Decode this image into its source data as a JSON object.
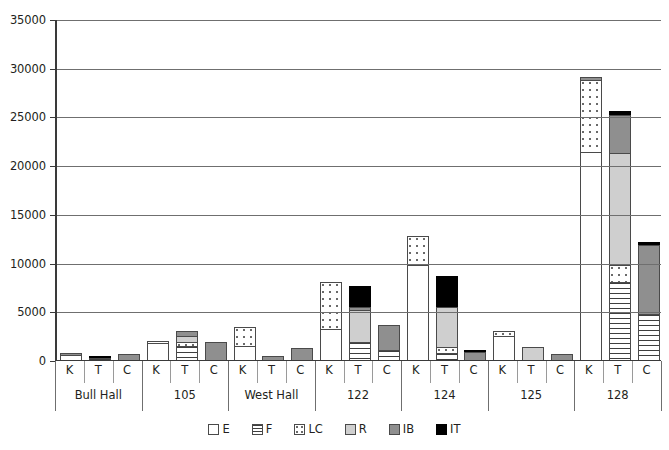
{
  "chart_data": {
    "type": "bar",
    "subtype": "stacked-grouped-bar",
    "title": "",
    "xlabel": "",
    "ylabel": "",
    "ylim": [
      0,
      35000
    ],
    "ytick_step": 5000,
    "yticks": [
      "0",
      "5000",
      "10000",
      "15000",
      "20000",
      "25000",
      "30000",
      "35000"
    ],
    "grid": "horizontal",
    "legend_position": "bottom-center",
    "series": [
      {
        "name": "E",
        "key": "E",
        "fill": "white"
      },
      {
        "name": "F",
        "key": "F",
        "fill": "horizontal-lines"
      },
      {
        "name": "LC",
        "key": "LC",
        "fill": "dotted"
      },
      {
        "name": "R",
        "key": "R",
        "fill": "light-gray",
        "color": "#cfcfcf"
      },
      {
        "name": "IB",
        "key": "IB",
        "fill": "medium-gray",
        "color": "#8f8f8f"
      },
      {
        "name": "IT",
        "key": "IT",
        "fill": "black",
        "color": "#000000"
      }
    ],
    "groups": [
      {
        "label": "Bull Hall",
        "bars": [
          {
            "label": "K",
            "total": 700,
            "segments": [
              {
                "series": "E",
                "value": 600
              },
              {
                "series": "IB",
                "value": 100
              }
            ]
          },
          {
            "label": "T",
            "total": 400,
            "segments": [
              {
                "series": "F",
                "value": 250
              },
              {
                "series": "IT",
                "value": 150
              }
            ]
          },
          {
            "label": "C",
            "total": 650,
            "segments": [
              {
                "series": "IB",
                "value": 650
              }
            ]
          }
        ]
      },
      {
        "label": "105",
        "bars": [
          {
            "label": "K",
            "total": 2000,
            "segments": [
              {
                "series": "E",
                "value": 1700
              },
              {
                "series": "LC",
                "value": 300
              }
            ]
          },
          {
            "label": "T",
            "total": 3000,
            "segments": [
              {
                "series": "F",
                "value": 1400
              },
              {
                "series": "LC",
                "value": 400
              },
              {
                "series": "R",
                "value": 700
              },
              {
                "series": "IB",
                "value": 500
              }
            ]
          },
          {
            "label": "C",
            "total": 1900,
            "segments": [
              {
                "series": "IB",
                "value": 1900
              }
            ]
          }
        ]
      },
      {
        "label": "West Hall",
        "bars": [
          {
            "label": "K",
            "total": 3400,
            "segments": [
              {
                "series": "E",
                "value": 1400
              },
              {
                "series": "LC",
                "value": 2000
              }
            ]
          },
          {
            "label": "T",
            "total": 400,
            "segments": [
              {
                "series": "IB",
                "value": 400
              }
            ]
          },
          {
            "label": "C",
            "total": 1200,
            "segments": [
              {
                "series": "IB",
                "value": 1200
              }
            ]
          }
        ]
      },
      {
        "label": "122",
        "bars": [
          {
            "label": "K",
            "total": 8000,
            "segments": [
              {
                "series": "E",
                "value": 3200
              },
              {
                "series": "LC",
                "value": 4800
              }
            ]
          },
          {
            "label": "T",
            "total": 7600,
            "segments": [
              {
                "series": "F",
                "value": 1800
              },
              {
                "series": "R",
                "value": 3300
              },
              {
                "series": "IB",
                "value": 300
              },
              {
                "series": "IT",
                "value": 2200
              }
            ]
          },
          {
            "label": "C",
            "total": 3600,
            "segments": [
              {
                "series": "F",
                "value": 1000
              },
              {
                "series": "IB",
                "value": 2600
              }
            ]
          }
        ]
      },
      {
        "label": "124",
        "bars": [
          {
            "label": "K",
            "total": 12700,
            "segments": [
              {
                "series": "E",
                "value": 9800
              },
              {
                "series": "LC",
                "value": 2900
              }
            ]
          },
          {
            "label": "T",
            "total": 8600,
            "segments": [
              {
                "series": "F",
                "value": 700
              },
              {
                "series": "LC",
                "value": 600
              },
              {
                "series": "R",
                "value": 4100
              },
              {
                "series": "IT",
                "value": 3200
              }
            ]
          },
          {
            "label": "C",
            "total": 1000,
            "segments": [
              {
                "series": "IB",
                "value": 800
              },
              {
                "series": "IT",
                "value": 200
              }
            ]
          }
        ]
      },
      {
        "label": "125",
        "bars": [
          {
            "label": "K",
            "total": 3000,
            "segments": [
              {
                "series": "E",
                "value": 2500
              },
              {
                "series": "LC",
                "value": 500
              }
            ]
          },
          {
            "label": "T",
            "total": 1300,
            "segments": [
              {
                "series": "R",
                "value": 1300
              }
            ]
          },
          {
            "label": "C",
            "total": 650,
            "segments": [
              {
                "series": "IB",
                "value": 650
              }
            ]
          }
        ]
      },
      {
        "label": "128",
        "bars": [
          {
            "label": "K",
            "total": 29000,
            "segments": [
              {
                "series": "E",
                "value": 21400
              },
              {
                "series": "LC",
                "value": 7300
              },
              {
                "series": "IB",
                "value": 300
              }
            ]
          },
          {
            "label": "T",
            "total": 25600,
            "segments": [
              {
                "series": "F",
                "value": 8000
              },
              {
                "series": "LC",
                "value": 1800
              },
              {
                "series": "R",
                "value": 11500
              },
              {
                "series": "IB",
                "value": 3800
              },
              {
                "series": "IT",
                "value": 500
              }
            ]
          },
          {
            "label": "C",
            "total": 12100,
            "segments": [
              {
                "series": "F",
                "value": 4700
              },
              {
                "series": "IB",
                "value": 7100
              },
              {
                "series": "IT",
                "value": 300
              }
            ]
          }
        ]
      }
    ]
  }
}
